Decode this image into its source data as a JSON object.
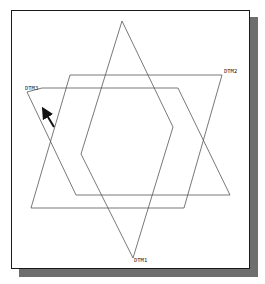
{
  "figure": {
    "labels": {
      "dtm1": "DTM1",
      "dtm2": "DTM2",
      "dtm3": "DTM3"
    },
    "colors": {
      "line": "#555555",
      "frame": "#1a1a1a",
      "shadow": "#6e6e6e",
      "arrow": "#111111"
    },
    "shapes": {
      "dtm1_rhombus": "122,21 173,127 133,258 81,154",
      "dtm2_parallelogram": "70,75 222,75 184,208 31,208",
      "dtm3_parallelogram": "42,88 178,88 230,195 76,195 27,92"
    }
  }
}
